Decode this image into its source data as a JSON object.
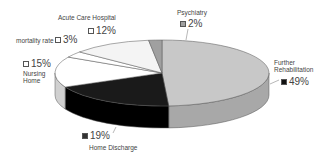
{
  "chart_data": {
    "type": "pie",
    "style": "3d",
    "title": "",
    "categories": [
      "Further Rehabilitation",
      "Home Discharge",
      "Nursing Home",
      "mortality rate",
      "Acute Care Hospital",
      "Psychiatry"
    ],
    "values": [
      49,
      19,
      15,
      3,
      12,
      2
    ],
    "unit": "%",
    "colors": [
      "#c8c8c8",
      "#1a1a1a",
      "#ffffff",
      "#ffffff",
      "#f4f4f4",
      "#a0a0a0"
    ],
    "legend": "none (inline labels)"
  },
  "labels": {
    "further_rehab": {
      "name": "Further\nRehabilitation",
      "line1": "Further",
      "line2": "Rehabilitation",
      "pct": "49%"
    },
    "home_discharge": {
      "name": "Home Discharge",
      "pct": "19%"
    },
    "nursing_home": {
      "line1": "Nursing",
      "line2": "Home",
      "pct": "15%"
    },
    "mortality": {
      "name": "mortality rate",
      "pct": "3%"
    },
    "acute_care": {
      "name": "Acute Care Hospital",
      "pct": "12%"
    },
    "psychiatry": {
      "name": "Psychiatry",
      "pct": "2%"
    }
  }
}
